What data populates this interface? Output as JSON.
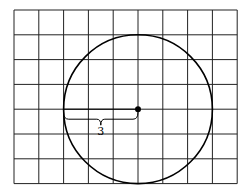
{
  "diagram": {
    "type": "circle-on-grid",
    "grid": {
      "columns": 9,
      "rows": 7,
      "cell_size_px": 24.8,
      "origin_px": [
        14,
        10
      ]
    },
    "circle": {
      "center_grid": [
        5,
        4
      ],
      "radius_units": 3
    },
    "radius_label": "3",
    "colors": {
      "line": "#000000",
      "grid": "#222222",
      "background": "#ffffff"
    }
  }
}
